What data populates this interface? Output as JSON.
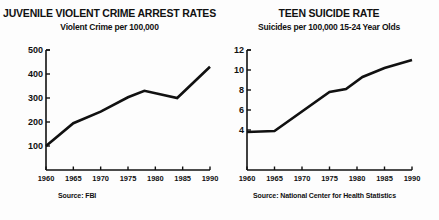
{
  "page": {
    "background": "#fdfdfd",
    "ink": "#111111"
  },
  "charts": [
    {
      "id": "juvenile-violent-crime",
      "title": "JUVENILE VIOLENT CRIME ARREST RATES",
      "subtitle": "Violent Crime per 100,000",
      "source": "Source: FBI"
    },
    {
      "id": "teen-suicide-rate",
      "title": "TEEN SUICIDE RATE",
      "subtitle": "Suicides per 100,000 15-24 Year Olds",
      "source": "Source: National Center for Health Statistics"
    }
  ],
  "chart_data": [
    {
      "type": "line",
      "title": "JUVENILE VIOLENT CRIME ARREST RATES",
      "subtitle": "Violent Crime per 100,000",
      "xlabel": "",
      "ylabel": "Violent Crime per 100,000",
      "source": "Source: FBI",
      "xlim": [
        1960,
        1990
      ],
      "ylim": [
        0,
        500
      ],
      "xticks": [
        1960,
        1965,
        1970,
        1975,
        1980,
        1985,
        1990
      ],
      "xticklabels": [
        "1960",
        "1965",
        "1970",
        "1975",
        "1980",
        "1985",
        "1990"
      ],
      "yticks": [
        100,
        200,
        300,
        400,
        500
      ],
      "yticklabels": [
        "100",
        "200",
        "300",
        "400",
        "500"
      ],
      "grid": false,
      "legend": false,
      "line_color": "#111111",
      "x": [
        1960,
        1965,
        1970,
        1975,
        1978,
        1984,
        1990
      ],
      "values": [
        100,
        195,
        243,
        303,
        330,
        300,
        430
      ],
      "series": [
        {
          "name": "Juvenile violent crime arrest rate",
          "x": [
            1960,
            1965,
            1970,
            1975,
            1978,
            1984,
            1990
          ],
          "values": [
            100,
            195,
            243,
            303,
            330,
            300,
            430
          ]
        }
      ]
    },
    {
      "type": "line",
      "title": "TEEN SUICIDE RATE",
      "subtitle": "Suicides per 100,000 15-24 Year Olds",
      "xlabel": "",
      "ylabel": "Suicides per 100,000 15-24 Year Olds",
      "source": "Source: National Center for Health Statistics",
      "xlim": [
        1960,
        1990
      ],
      "ylim": [
        0,
        12
      ],
      "xticks": [
        1960,
        1965,
        1970,
        1975,
        1980,
        1985,
        1990
      ],
      "xticklabels": [
        "1960",
        "1965",
        "1970",
        "1975",
        "1980",
        "1985",
        "1990"
      ],
      "yticks": [
        4,
        6,
        8,
        10,
        12
      ],
      "yticklabels": [
        "4",
        "6",
        "8",
        "10",
        "12"
      ],
      "grid": false,
      "legend": false,
      "line_color": "#111111",
      "x": [
        1960,
        1965,
        1975,
        1978,
        1981,
        1985,
        1990
      ],
      "values": [
        3.8,
        3.9,
        7.8,
        8.1,
        9.3,
        10.2,
        11.0
      ],
      "series": [
        {
          "name": "Teen suicide rate",
          "x": [
            1960,
            1965,
            1975,
            1978,
            1981,
            1985,
            1990
          ],
          "values": [
            3.8,
            3.9,
            7.8,
            8.1,
            9.3,
            10.2,
            11.0
          ]
        }
      ]
    }
  ]
}
